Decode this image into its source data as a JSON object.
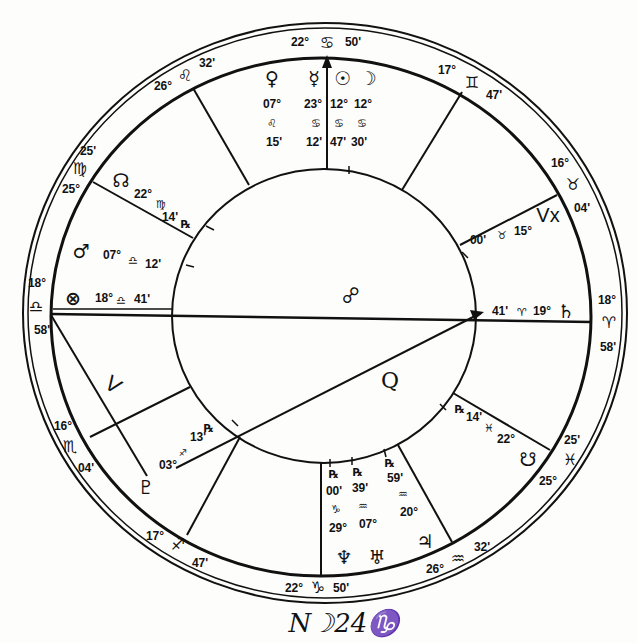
{
  "chart": {
    "cusps": {
      "mc": {
        "deg": "22°",
        "sign": "♋",
        "min": "50'"
      },
      "h11": {
        "deg": "26°",
        "sign": "♌",
        "min": "32'"
      },
      "h12": {
        "deg": "25°",
        "sign": "♍",
        "min": "25'"
      },
      "asc": {
        "deg": "18°",
        "sign": "♎",
        "min": "58'"
      },
      "h2": {
        "deg": "16°",
        "sign": "♏",
        "min": "04'"
      },
      "h3": {
        "deg": "17°",
        "sign": "♐",
        "min": "47'"
      },
      "ic": {
        "deg": "22°",
        "sign": "♑",
        "min": "50'"
      },
      "h5": {
        "deg": "26°",
        "sign": "♒",
        "min": "32'"
      },
      "h6": {
        "deg": "25°",
        "sign": "♓",
        "min": "25'"
      },
      "dsc": {
        "deg": "18°",
        "sign": "♈",
        "min": "58'"
      },
      "h8": {
        "deg": "16°",
        "sign": "♉",
        "min": "04'"
      },
      "h9": {
        "deg": "17°",
        "sign": "♊",
        "min": "47'"
      }
    },
    "planets": {
      "venus": {
        "glyph": "♀",
        "deg": "07°",
        "sign": "♌",
        "min": "15'"
      },
      "mercury": {
        "glyph": "☿",
        "deg": "23°",
        "sign": "♋",
        "min": "12'"
      },
      "sun": {
        "glyph": "☉",
        "deg": "12°",
        "sign": "♋",
        "min": "47'"
      },
      "moon": {
        "glyph": "☽",
        "deg": "12°",
        "sign": "♋",
        "min": "30'"
      },
      "north_node": {
        "glyph": "☊",
        "deg": "22°",
        "sign": "♍",
        "min": "14'",
        "retro": "℞"
      },
      "mars": {
        "glyph": "♂",
        "deg": "07°",
        "sign": "♎",
        "min": "12'"
      },
      "fortune": {
        "glyph": "⊗",
        "deg": "18°",
        "sign": "♎",
        "min": "41'"
      },
      "pluto": {
        "glyph": "♇",
        "deg": "03°",
        "sign": "♐",
        "min": "13'",
        "retro": "℞"
      },
      "neptune": {
        "glyph": "♆",
        "deg": "29°",
        "sign": "♑",
        "min": "00'",
        "retro": "℞"
      },
      "uranus": {
        "glyph": "♅",
        "deg": "07°",
        "sign": "♒",
        "min": "39'",
        "retro": "℞"
      },
      "jupiter": {
        "glyph": "♃",
        "deg": "20°",
        "sign": "♒",
        "min": "59'",
        "retro": "℞"
      },
      "south_node": {
        "glyph": "☋",
        "deg": "22°",
        "sign": "♓",
        "min": "14'",
        "retro": "℞"
      },
      "saturn": {
        "glyph": "♄",
        "deg": "19°",
        "sign": "♈",
        "min": "41'"
      },
      "vertex": {
        "glyph": "Vx",
        "deg": "15°",
        "sign": "♉",
        "min": "00'"
      }
    },
    "aspects": {
      "opposition": "☍",
      "quincunx": "Q",
      "semisextile": "V"
    },
    "signature": "N☽24♑"
  }
}
